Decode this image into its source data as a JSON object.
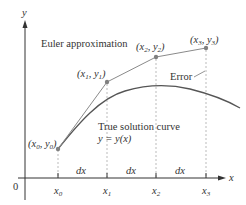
{
  "figure": {
    "axes": {
      "x_label": "x",
      "y_label": "y",
      "origin_label": "0",
      "ticks": [
        {
          "main": "x",
          "sub": "0"
        },
        {
          "main": "x",
          "sub": "1"
        },
        {
          "main": "x",
          "sub": "2"
        },
        {
          "main": "x",
          "sub": "3"
        }
      ],
      "step_label": "dx"
    },
    "labels": {
      "euler": "Euler approximation",
      "true_curve_line1": "True solution curve",
      "true_curve_line2": "y = y(x)",
      "error": "Error"
    },
    "points": [
      {
        "id": "p0",
        "text": "(x0, y0)"
      },
      {
        "id": "p1",
        "text": "(x1, y1)"
      },
      {
        "id": "p2",
        "text": "(x2, y2)"
      },
      {
        "id": "p3",
        "text": "(x3, y3)"
      }
    ],
    "colors": {
      "axis": "#333333",
      "euler_line": "#8a8a8a",
      "curve": "#555555",
      "guides": "#aaaaaa",
      "point": "#808080"
    }
  }
}
